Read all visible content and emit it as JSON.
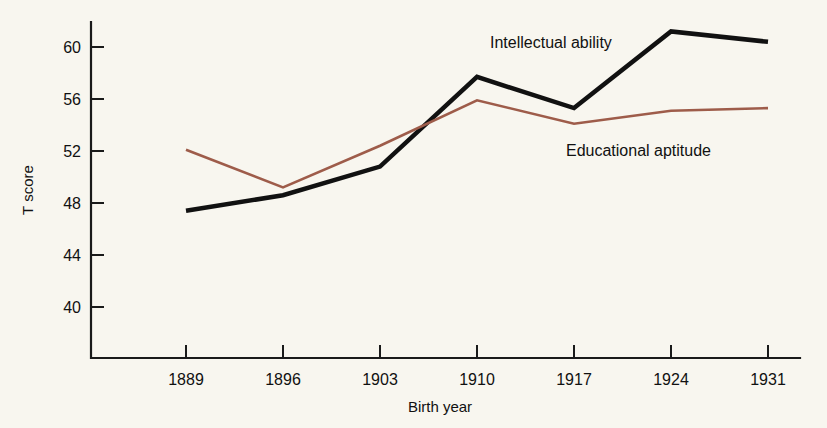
{
  "chart_data": {
    "type": "line",
    "title": "",
    "xlabel": "Birth year",
    "ylabel": "T score",
    "categories": [
      "1889",
      "1896",
      "1903",
      "1910",
      "1917",
      "1924",
      "1931"
    ],
    "x": [
      1889,
      1896,
      1903,
      1910,
      1917,
      1924,
      1931
    ],
    "xtick_labels": [
      "1889",
      "1896",
      "1903",
      "1910",
      "1917",
      "1924",
      "1931"
    ],
    "ytick_labels": [
      "40",
      "44",
      "48",
      "52",
      "56",
      "60"
    ],
    "yticks": [
      40,
      44,
      48,
      52,
      56,
      60
    ],
    "ylim": [
      37.5,
      62.5
    ],
    "grid": false,
    "legend_position": "inline-annotations",
    "series": [
      {
        "name": "Intellectual ability",
        "color": "#111111",
        "values": [
          47.4,
          48.6,
          50.8,
          57.7,
          55.3,
          61.2,
          60.4
        ],
        "label_x": 1911.5,
        "label_y": 62.0
      },
      {
        "name": "Educational aptitude",
        "color": "#9e5c4a",
        "values": [
          52.1,
          49.2,
          52.4,
          55.9,
          54.1,
          55.1,
          55.3
        ],
        "label_x": 1913.0,
        "label_y": 52.6
      }
    ],
    "annotations": [
      {
        "text": "Intellectual ability",
        "series": 0
      },
      {
        "text": "Educational aptitude",
        "series": 1
      }
    ]
  },
  "colors": {
    "background": "#f8f6ef",
    "axis": "#1a1a1a",
    "intellectual_ability": "#111111",
    "educational_aptitude": "#9e5c4a"
  }
}
